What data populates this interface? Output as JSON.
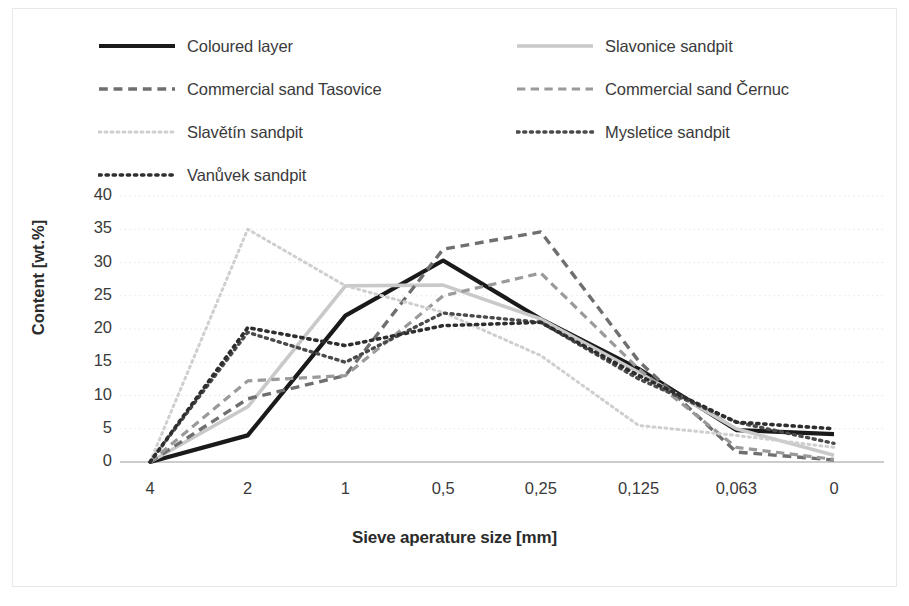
{
  "chart_data": {
    "type": "line",
    "title": "",
    "xlabel": "Sieve aperature size [mm]",
    "ylabel": "Content [wt.%]",
    "categories": [
      "4",
      "2",
      "1",
      "0,5",
      "0,25",
      "0,125",
      "0,063",
      "0"
    ],
    "ylim": [
      0,
      40
    ],
    "ytick_labels": [
      "40",
      "35",
      "30",
      "25",
      "20",
      "15",
      "10",
      "5",
      "0"
    ],
    "ytick_values": [
      40,
      35,
      30,
      25,
      20,
      15,
      10,
      5,
      0
    ],
    "grid": "horizontal-dotted",
    "legend_position": "top",
    "series": [
      {
        "name": "Coloured layer",
        "values": [
          0,
          4,
          22,
          30.3,
          21.5,
          14,
          4.8,
          4.2
        ],
        "color": "#1a1a1a",
        "style": "solid",
        "width": 4.2
      },
      {
        "name": "Slavonice sandpit",
        "values": [
          0,
          8.3,
          26.5,
          26.6,
          21.5,
          13.5,
          5,
          1
        ],
        "color": "#c9c9c9",
        "style": "solid",
        "width": 3.6
      },
      {
        "name": "Commercial sand Tasovice",
        "values": [
          0,
          9.5,
          13,
          32,
          34.6,
          15.2,
          1.5,
          0.3
        ],
        "color": "#6f6f6f",
        "style": "dashed",
        "width": 3.4
      },
      {
        "name": "Commercial sand Černuc",
        "values": [
          0,
          12.2,
          13,
          25,
          28.4,
          14,
          2.2,
          0.4
        ],
        "color": "#9a9a9a",
        "style": "dashed",
        "width": 3.2
      },
      {
        "name": "Slavětín sandpit",
        "values": [
          0,
          35,
          26.5,
          22.5,
          16,
          5.5,
          4,
          2.2
        ],
        "color": "#cfcfcf",
        "style": "dotted",
        "width": 3.0
      },
      {
        "name": "Mysletice sandpit",
        "values": [
          0,
          19.5,
          15,
          22.4,
          21,
          12.5,
          6,
          2.8
        ],
        "color": "#4a4a4a",
        "style": "dotted",
        "width": 3.4
      },
      {
        "name": "Vanůvek sandpit",
        "values": [
          0,
          20.2,
          17.5,
          20.5,
          21,
          13,
          6,
          5
        ],
        "color": "#2e2e2e",
        "style": "dotted",
        "width": 3.6
      }
    ]
  },
  "legend": {
    "left_column": [
      {
        "label": "Coloured layer",
        "series_index": 0
      },
      {
        "label": "Commercial sand Tasovice",
        "series_index": 2
      },
      {
        "label": "Slavětín sandpit",
        "series_index": 4
      },
      {
        "label": "Vanůvek sandpit",
        "series_index": 6
      }
    ],
    "right_column": [
      {
        "label": "Slavonice sandpit",
        "series_index": 1
      },
      {
        "label": "Commercial sand Černuc",
        "series_index": 3
      },
      {
        "label": "Mysletice sandpit",
        "series_index": 5
      }
    ]
  },
  "colors": {
    "background": "#ffffff",
    "gridline": "#e6e6e6",
    "axis": "#bdbdbd",
    "text": "#3a3a3a",
    "frame": "#e8e8e8"
  }
}
